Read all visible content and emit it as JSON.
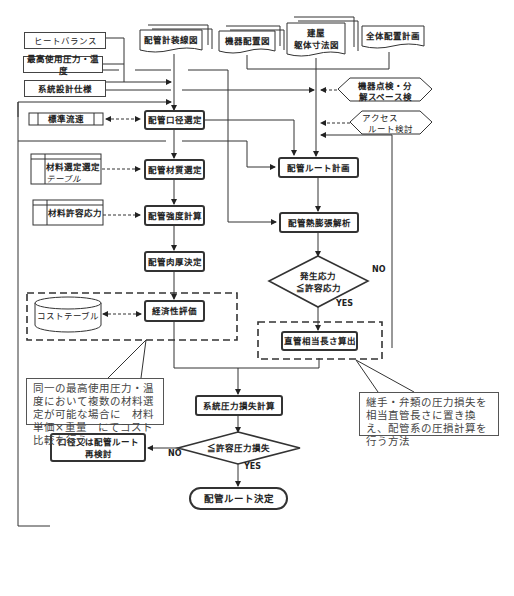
{
  "inputs": {
    "heat_balance": "ヒートバランス",
    "max_pressure_temp": "最高使用圧力・温度",
    "system_design_spec": "系統設計仕様",
    "standard_flow": "標準流速",
    "material_selection_table_1": "材料選定選定",
    "material_selection_table_2": "テーブル",
    "material_allowable_stress": "材料許容応力",
    "cost_table": "コストテーブル"
  },
  "documents": {
    "piping_system_diagram": "配管計装線図",
    "equipment_layout": "機器配置図",
    "building_1": "建屋",
    "building_2": "躯体寸法図",
    "overall_layout_plan": "全体配置計画"
  },
  "considerations": {
    "maintenance_space_1": "機器点検・分",
    "maintenance_space_2": "解スペース検",
    "access_route_1": "アクセス",
    "access_route_2": "ルート検討"
  },
  "process": {
    "diameter_selection": "配管口径選定",
    "material_selection": "配管材質選定",
    "strength_calc": "配管強度計算",
    "wall_thickness": "配管肉厚決定",
    "economic_eval": "経済性評価",
    "route_plan": "配管ルート計画",
    "thermal_expansion": "配管熱膨張解析",
    "equiv_length": "直管相当長さ算出",
    "system_pressure_loss": "系統圧力損失計算",
    "recheck_1": "口径又は配管ルート",
    "recheck_2": "再検討",
    "route_decided": "配管ルート決定"
  },
  "decisions": {
    "stress_1": "発生応力",
    "stress_2": "≦許容応力",
    "pressure_loss": "≦許容圧力損失",
    "yes": "YES",
    "no": "NO"
  },
  "notes": {
    "cost_note": "同一の最高使用圧力・温度において複数の材料選定が可能な場合に　材料単価×重量　にてコスト比較を行う",
    "equiv_note": "継手・弁類の圧力損失を相当直管長さに置き換え、配管系の圧損計算を行う方法"
  }
}
